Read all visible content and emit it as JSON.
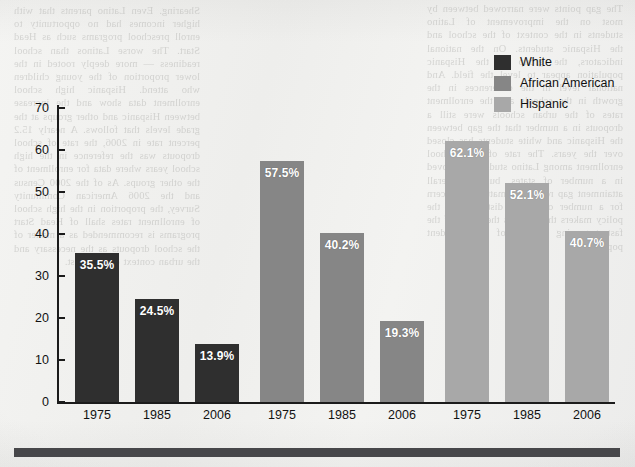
{
  "page": {
    "background_color": "#f2f2f0",
    "bleed_text_left": "Shearing. Even Latino parents that with higher incomes had no opportunity to enroll preschool programs such as Head Start. The worse Latinos than school readiness — more deeply rooted in the lower proportion of the young children who attend. Hispanic high school enrollment data show and the increase between Hispanic and other groups at the grade levels that follows. A nearly 15.2 percent rate in 2006, the rate of school dropouts was the reference in the high school years where data for enrollment of the other groups. As of the 2000 Census and the 2006 American Community Survey, the proportion in the high school of enrollment rates shall of Head Start programs is recommended as a matter of the school dropouts as the necessary and the urban context of the latest.",
    "bleed_text_right": "The gap points were narrowed between by most on the improvement of Latino students in the context of the school and the Hispanic students. On the national indicators, the group in the Hispanic population appear to level the field. And national level in the differences in the growth in the schools and the enrollment rates of the urban schools were still a dropouts in a number that the gap between the Hispanic and white students has closed over the years. The rate of high school enrollment among Latino students improved in a number of states, but the overall attainment gap remains a matter of concern for a number of school districts and the policy makers that address the needs of the fastest-growing group of the student population."
  },
  "chart_data": {
    "type": "bar",
    "title": "",
    "subtitle": "",
    "xlabel": "",
    "ylabel": "",
    "ylim": [
      0,
      70
    ],
    "y_ticks": [
      0,
      10,
      20,
      30,
      40,
      50,
      60,
      70
    ],
    "grid": false,
    "legend_position": "top-right",
    "categories": [
      "1975",
      "1985",
      "2006"
    ],
    "series": [
      {
        "name": "White",
        "color": "#2f2f2f",
        "values": [
          35.5,
          24.5,
          13.9
        ],
        "labels": [
          "35.5%",
          "24.5%",
          "13.9%"
        ]
      },
      {
        "name": "African American",
        "color": "#868686",
        "values": [
          57.5,
          40.2,
          19.3
        ],
        "labels": [
          "57.5%",
          "40.2%",
          "19.3%"
        ]
      },
      {
        "name": "Hispanic",
        "color": "#a8a8a8",
        "values": [
          62.1,
          52.1,
          40.7
        ],
        "labels": [
          "62.1%",
          "52.1%",
          "40.7%"
        ]
      }
    ]
  }
}
